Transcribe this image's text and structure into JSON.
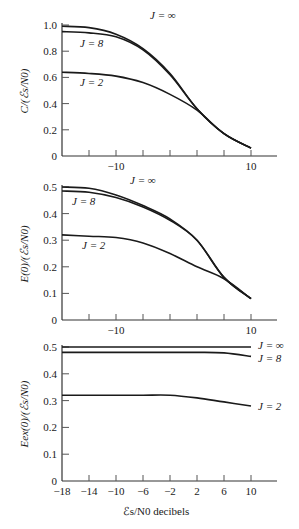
{
  "chart_data": [
    {
      "type": "line",
      "panel": "top",
      "ylabel": "C/(ℰs/N0)",
      "xlabel": "",
      "xlim": [
        -18,
        13
      ],
      "ylim": [
        0,
        1.0
      ],
      "yticks": [
        0,
        0.2,
        0.4,
        0.6,
        0.8,
        1.0
      ],
      "ytick_labels": [
        "0",
        "0.2",
        "0.4",
        "0.6",
        "0.8",
        "1.0"
      ],
      "xticks": [
        -14,
        -10,
        -6,
        -2,
        2,
        6,
        10
      ],
      "xtick_labels_shown": {
        "-10": "−10",
        "10": "10"
      },
      "grid": false,
      "x": [
        -18,
        -14,
        -10,
        -6,
        -2,
        2,
        6,
        10
      ],
      "series": [
        {
          "name": "J = ∞",
          "values": [
            0.99,
            0.98,
            0.93,
            0.82,
            0.63,
            0.36,
            0.17,
            0.06
          ]
        },
        {
          "name": "J = 8",
          "values": [
            0.95,
            0.94,
            0.91,
            0.81,
            0.62,
            0.36,
            0.17,
            0.06
          ]
        },
        {
          "name": "J = 2",
          "values": [
            0.64,
            0.63,
            0.61,
            0.56,
            0.47,
            0.35,
            0.17,
            0.06
          ]
        }
      ],
      "annotations": [
        "J = ∞",
        "J = 8",
        "J = 2"
      ]
    },
    {
      "type": "line",
      "panel": "middle",
      "ylabel": "E(0)/(ℰs/N0)",
      "xlabel": "",
      "xlim": [
        -18,
        13
      ],
      "ylim": [
        0,
        0.5
      ],
      "yticks": [
        0,
        0.1,
        0.2,
        0.3,
        0.4,
        0.5
      ],
      "ytick_labels": [
        "0",
        "0.1",
        "0.2",
        "0.3",
        "0.4",
        "0.5"
      ],
      "xticks": [
        -14,
        -10,
        -6,
        -2,
        2,
        6,
        10
      ],
      "xtick_labels_shown": {
        "-10": "−10",
        "10": "10"
      },
      "grid": false,
      "x": [
        -18,
        -14,
        -10,
        -6,
        -2,
        2,
        6,
        10
      ],
      "series": [
        {
          "name": "J = ∞",
          "values": [
            0.5,
            0.495,
            0.47,
            0.43,
            0.38,
            0.3,
            0.16,
            0.08
          ]
        },
        {
          "name": "J = 8",
          "values": [
            0.485,
            0.48,
            0.46,
            0.425,
            0.375,
            0.3,
            0.16,
            0.08
          ]
        },
        {
          "name": "J = 2",
          "values": [
            0.32,
            0.315,
            0.31,
            0.29,
            0.25,
            0.2,
            0.155,
            0.08
          ]
        }
      ],
      "annotations": [
        "J = ∞",
        "J = 8",
        "J = 2"
      ]
    },
    {
      "type": "line",
      "panel": "bottom",
      "ylabel": "Eex(0)/(ℰs/N0)",
      "xlabel": "ℰs/N0 decibels",
      "xlim": [
        -18,
        13
      ],
      "ylim": [
        0,
        0.5
      ],
      "yticks": [
        0,
        0.1,
        0.2,
        0.3,
        0.4,
        0.5
      ],
      "ytick_labels": [
        "0",
        "0.1",
        "0.2",
        "0.3",
        "0.4",
        "0.5"
      ],
      "xticks": [
        -18,
        -14,
        -10,
        -6,
        -2,
        2,
        6,
        10
      ],
      "xtick_labels": [
        "−18",
        "−14",
        "−10",
        "−6",
        "−2",
        "2",
        "6",
        "10"
      ],
      "grid": false,
      "x": [
        -18,
        -14,
        -10,
        -6,
        -2,
        2,
        6,
        10
      ],
      "series": [
        {
          "name": "J = ∞",
          "values": [
            0.5,
            0.5,
            0.5,
            0.5,
            0.5,
            0.5,
            0.5,
            0.5
          ]
        },
        {
          "name": "J = 8",
          "values": [
            0.48,
            0.48,
            0.48,
            0.48,
            0.48,
            0.48,
            0.478,
            0.465
          ]
        },
        {
          "name": "J = 2",
          "values": [
            0.32,
            0.32,
            0.32,
            0.32,
            0.32,
            0.31,
            0.295,
            0.28
          ]
        }
      ],
      "annotations": [
        "J = ∞",
        "J = 8",
        "J = 2"
      ]
    }
  ],
  "labels": {
    "top_ylabel": "C/(ℰs/N0)",
    "mid_ylabel": "E(0)/(ℰs/N0)",
    "bot_ylabel": "Eex(0)/(ℰs/N0)",
    "xlabel": "ℰs/N0 decibels",
    "j_inf": "J = ∞",
    "j_8": "J = 8",
    "j_2": "J = 2"
  }
}
